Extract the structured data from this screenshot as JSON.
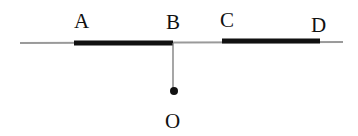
{
  "diagram": {
    "type": "geometry-line-segments",
    "colors": {
      "background": "#ffffff",
      "thin_line": "#9a9a9a",
      "thick_segment": "#111111",
      "point": "#111111",
      "text": "#111111"
    },
    "labels": {
      "A": "A",
      "B": "B",
      "C": "C",
      "D": "D",
      "O": "O"
    },
    "base_line": {
      "x1": 20,
      "y1": 43,
      "x2": 343,
      "y2": 42
    },
    "segments": [
      {
        "name": "AB",
        "from": "A",
        "to": "B",
        "x1": 74,
        "y1": 43,
        "x2": 173,
        "y2": 43
      },
      {
        "name": "CD",
        "from": "C",
        "to": "D",
        "x1": 222,
        "y1": 41,
        "x2": 320,
        "y2": 41
      }
    ],
    "perpendicular": {
      "from": "B",
      "to": "O",
      "x1": 173,
      "y1": 43,
      "x2": 173,
      "y2": 89
    },
    "point_O": {
      "cx": 174,
      "cy": 91,
      "r": 4
    }
  }
}
